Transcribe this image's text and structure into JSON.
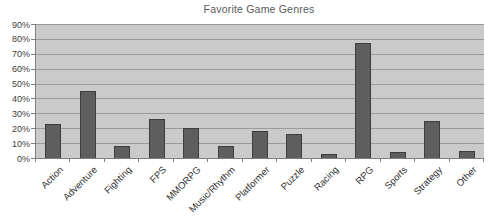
{
  "title": "Favorite Game Genres",
  "colors": {
    "page_bg": "#ffffff",
    "plot_bg": "#cacaca",
    "gridline": "#9b9b9b",
    "bar_fill": "#5e5e5e",
    "bar_border": "#3d3d3d",
    "axis_line": "#7f7f7f",
    "title_text": "#595959",
    "tick_text": "#333333"
  },
  "chart_data": {
    "type": "bar",
    "title": "Favorite Game Genres",
    "categories": [
      "Action",
      "Adventure",
      "Fighting",
      "FPS",
      "MMORPG",
      "Music/Rhythm",
      "Platformer",
      "Puzzle",
      "Racing",
      "RPG",
      "Sports",
      "Strategy",
      "Other"
    ],
    "values": [
      23,
      45,
      8,
      26,
      20,
      8,
      18,
      16,
      3,
      77,
      4,
      25,
      5
    ],
    "xlabel": "",
    "ylabel": "",
    "ylim": [
      0,
      90
    ],
    "ytick_step": 10,
    "ytick_labels": [
      "0%",
      "10%",
      "20%",
      "30%",
      "40%",
      "50%",
      "60%",
      "70%",
      "80%",
      "90%"
    ],
    "x_tick_rotation_deg": -45,
    "grid": true,
    "legend": false,
    "value_unit": "percent"
  }
}
